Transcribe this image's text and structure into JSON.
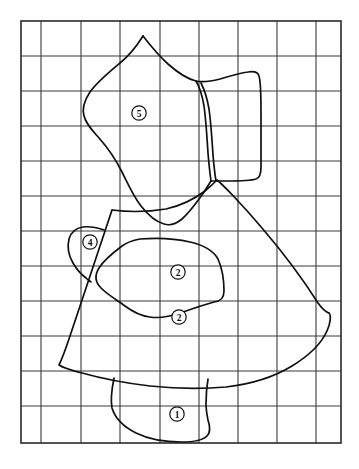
{
  "figure": {
    "type": "line-drawing",
    "background_color": "#ffffff",
    "ink_color": "#101010",
    "grid_color": "#3a3a3a"
  },
  "grid": {
    "label": "reference grid",
    "left": 21,
    "top": 21,
    "right": 341,
    "bottom": 443,
    "columns": 9,
    "rows": 12,
    "x_lines": [
      21,
      41,
      81,
      120,
      160,
      199,
      238,
      277,
      316,
      341
    ],
    "y_lines": [
      21,
      56,
      91,
      126,
      161,
      196,
      231,
      266,
      301,
      336,
      371,
      406,
      443
    ],
    "line_width": 1.1
  },
  "zones": [
    {
      "id": "zone-1",
      "label": "①",
      "number": 1,
      "label_x": 177,
      "label_y": 415,
      "path": "M 113 379 C 113 379 110 392 112 403 C 114 414 122 424 133 430 C 146 437 163 440 180 441 C 192 441 201 439 206 435 C 209 432 209 426 207 420 C 206 416 205 412 205 408 C 205 398 206 390 207 383"
    },
    {
      "id": "zone-2",
      "label": "②",
      "number": 2,
      "label_x": 178,
      "label_y": 317,
      "path": "M 112 210 C 98 250 80 300 66 346 C 62 358 60 364 60 364 C 60 364 66 366 78 370 C 96 376 120 382 147 386 C 175 390 202 390 224 388 C 250 385 272 378 290 368 C 308 358 320 345 326 332 C 331 321 331 314 329 312 C 327 310 322 311 320 313"
    },
    {
      "id": "zone-2b",
      "label": "zone-2 upper boundary",
      "number": 2,
      "label_x": 0,
      "label_y": 0,
      "path": "M 112 210 C 130 212 150 212 168 208 C 186 204 198 196 206 190 C 212 185 216 181 218 179 C 222 182 240 200 262 226 C 286 254 306 282 318 302 C 322 308 325 311 326 312"
    },
    {
      "id": "zone-3",
      "label": "③",
      "number": 3,
      "label_x": 178,
      "label_y": 272,
      "path": "M 118 247 C 112 253 102 261 98 268 C 94 275 95 280 100 285 C 106 291 115 296 122 301 C 130 307 138 312 148 314 C 160 317 172 314 184 310 C 196 306 206 303 214 301 C 221 300 224 297 224 290 C 224 280 223 268 219 260 C 215 252 206 247 194 244 C 178 240 160 239 146 240 C 132 241 123 243 118 247"
    },
    {
      "id": "zone-4",
      "label": "④",
      "number": 4,
      "label_x": 90,
      "label_y": 243
    },
    {
      "id": "zone-5",
      "label": "⑤",
      "number": 5,
      "label_x": 139,
      "label_y": 113
    }
  ],
  "annotations": {
    "circled_numbers": [
      "①",
      "②",
      "③",
      "④",
      "⑤"
    ],
    "count": 5,
    "style": "bold serif numerals inside thin circles"
  }
}
